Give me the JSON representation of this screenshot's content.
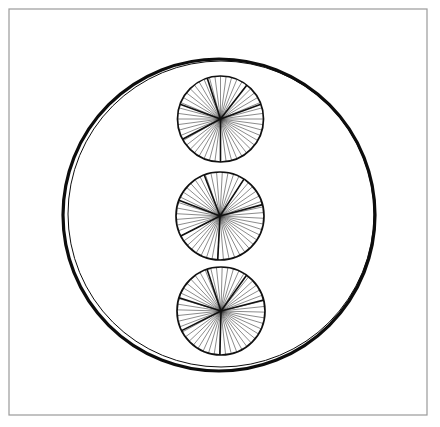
{
  "figure": {
    "canvas": {
      "width": 440,
      "height": 427,
      "background_color": "#ffffff"
    },
    "frame": {
      "name": "border-rectangle",
      "x": 9,
      "y": 9,
      "width": 418,
      "height": 406,
      "stroke_color": "#9a9a9a",
      "stroke_width": 1.2,
      "fill": "none"
    },
    "outer_circle": {
      "name": "large-circle",
      "center_x": 219,
      "center_y": 215,
      "radius": 156,
      "stroke_color": "#0d0d0d",
      "stroke_width_outer": 3.2,
      "stroke_width_inner": 1.0,
      "inner_offset_x": 2,
      "inner_offset_y": -1,
      "inner_radius": 153,
      "fill": "none"
    },
    "wheels": [
      {
        "name": "wheel-top",
        "center_x": 220.5,
        "center_y": 119,
        "radius": 43,
        "rim_stroke_width": 1.7,
        "rim_stroke_color": "#111111",
        "thin_spoke_count": 48,
        "thin_spoke_width": 0.55,
        "thin_spoke_color": "#2b2b2b",
        "thick_spoke_width": 1.6,
        "thick_spoke_color": "#111111",
        "thick_spoke_angles": [
          90,
          152,
          200,
          252,
          308,
          340
        ],
        "rotation": 0
      },
      {
        "name": "wheel-middle",
        "center_x": 220,
        "center_y": 216,
        "radius": 44,
        "rim_stroke_width": 1.7,
        "rim_stroke_color": "#111111",
        "thin_spoke_count": 48,
        "thin_spoke_width": 0.55,
        "thin_spoke_color": "#2b2b2b",
        "thick_spoke_width": 1.6,
        "thick_spoke_color": "#111111",
        "thick_spoke_angles": [
          90,
          150,
          198,
          246,
          300,
          342
        ],
        "rotation": 3
      },
      {
        "name": "wheel-bottom",
        "center_x": 221,
        "center_y": 311,
        "radius": 44,
        "rim_stroke_width": 1.7,
        "rim_stroke_color": "#111111",
        "thin_spoke_count": 48,
        "thin_spoke_width": 0.55,
        "thin_spoke_color": "#2b2b2b",
        "thick_spoke_width": 1.6,
        "thick_spoke_color": "#111111",
        "thick_spoke_angles": [
          90,
          152,
          196,
          250,
          304,
          344
        ],
        "rotation": 1.5
      }
    ]
  }
}
